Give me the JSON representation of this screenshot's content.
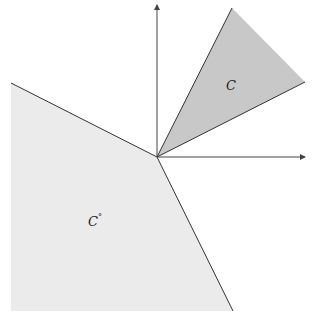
{
  "diagram": {
    "title": "",
    "cone": {
      "label": "C",
      "fill": "#c8c8c8",
      "stroke": "#333333",
      "vertices": [
        [
          157,
          157
        ],
        [
          232,
          8
        ],
        [
          305,
          82
        ]
      ]
    },
    "polar_cone": {
      "label": "C",
      "label_superscript": "°",
      "fill": "#ebebeb",
      "stroke": "#333333",
      "vertices": [
        [
          11,
          83
        ],
        [
          157,
          157
        ],
        [
          233,
          311
        ],
        [
          11,
          311
        ]
      ]
    },
    "axes": {
      "origin": [
        157,
        157
      ],
      "x_axis_end": [
        305,
        157
      ],
      "y_axis_end": [
        157,
        5
      ],
      "color": "#444444"
    }
  }
}
